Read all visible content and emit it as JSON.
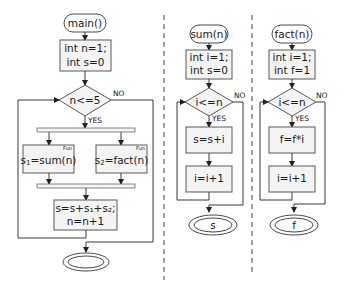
{
  "main": {
    "start": "main()",
    "init": [
      "int n=1;",
      "int s=0"
    ],
    "condition": "n<=5",
    "yes": "YES",
    "no": "NO",
    "call1": {
      "lhs": "s",
      "sub": "1",
      "rhs": "=sum(n)",
      "tag": "Fun"
    },
    "call2": {
      "lhs": "s",
      "sub": "2",
      "rhs": "=fact(n)",
      "tag": "Fun"
    },
    "update": [
      "s=s+s₁+s₂;",
      "n=n+1"
    ],
    "end": ""
  },
  "sum": {
    "start": "sum(n)",
    "init": [
      "int i=1;",
      "int s=0"
    ],
    "condition": "i<=n",
    "yes": "YES",
    "no": "NO",
    "step1": "s=s+i",
    "step2": "i=i+1",
    "end": "s"
  },
  "fact": {
    "start": "fact(n)",
    "init": [
      "int i=1;",
      "int f=1"
    ],
    "condition": "i<=n",
    "yes": "YES",
    "no": "NO",
    "step1": "f=f*i",
    "step2": "i=i+1",
    "end": "f"
  }
}
